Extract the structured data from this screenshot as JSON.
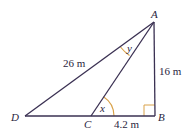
{
  "diagram": {
    "title": "",
    "colors": {
      "line": "#3a3052",
      "angle_arc": "#d9a24a",
      "right_angle": "#d9a24a",
      "text": "#2a2540"
    },
    "points": {
      "A": {
        "label": "A",
        "x": 154,
        "y": 22
      },
      "B": {
        "label": "B",
        "x": 155,
        "y": 116
      },
      "C": {
        "label": "C",
        "x": 91,
        "y": 116
      },
      "D": {
        "label": "D",
        "x": 25,
        "y": 116
      }
    },
    "segments": [
      {
        "from": "A",
        "to": "D",
        "length_label": "26 m"
      },
      {
        "from": "A",
        "to": "B",
        "length_label": "16 m"
      },
      {
        "from": "C",
        "to": "B",
        "length_label": "4.2 m"
      },
      {
        "from": "A",
        "to": "C",
        "length_label": ""
      },
      {
        "from": "D",
        "to": "C",
        "length_label": ""
      }
    ],
    "angles": {
      "x": {
        "label": "x",
        "at": "C",
        "between": [
          "A",
          "B"
        ]
      },
      "y": {
        "label": "y",
        "at": "A",
        "between": [
          "D",
          "C"
        ]
      },
      "right_angle": {
        "at": "B"
      }
    },
    "labels": {
      "A": "A",
      "B": "B",
      "C": "C",
      "D": "D",
      "AD": "26 m",
      "AB": "16 m",
      "CB": "4.2 m",
      "x": "x",
      "y": "y"
    }
  }
}
